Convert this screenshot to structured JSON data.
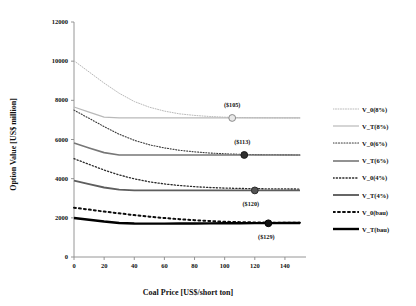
{
  "chart_data": {
    "type": "line",
    "title": "",
    "xlabel": "Coal Price [US$/short ton]",
    "ylabel": "Option Value [US$ million]",
    "xlim": [
      0,
      150
    ],
    "ylim": [
      0,
      12000
    ],
    "xticks": [
      0,
      20,
      40,
      60,
      80,
      100,
      120,
      140
    ],
    "yticks": [
      0,
      2000,
      4000,
      6000,
      8000,
      10000,
      12000
    ],
    "xtick_labels": [
      "0",
      "20",
      "40",
      "60",
      "80",
      "100",
      "120",
      "140"
    ],
    "ytick_labels": [
      "0",
      "2000",
      "4000",
      "6000",
      "8000",
      "10000",
      "12000"
    ],
    "grid": false,
    "legend_position": "right",
    "x": [
      0,
      10,
      20,
      30,
      40,
      50,
      60,
      70,
      80,
      90,
      100,
      110,
      120,
      130,
      140,
      150
    ],
    "series": [
      {
        "name": "V_0(8%)",
        "style": "dotted",
        "color": "#b9b9b9",
        "width": 1.0,
        "values": [
          10020,
          9450,
          8880,
          8360,
          7940,
          7650,
          7450,
          7310,
          7230,
          7175,
          7140,
          7120,
          7110,
          7105,
          7102,
          7100
        ]
      },
      {
        "name": "V_T(8%)",
        "style": "solid",
        "color": "#b9b9b9",
        "width": 1.2,
        "values": [
          7660,
          7400,
          7140,
          7100,
          7100,
          7100,
          7100,
          7100,
          7100,
          7100,
          7100,
          7100,
          7100,
          7100,
          7100,
          7100
        ]
      },
      {
        "name": "V_0(6%)",
        "style": "dotted",
        "color": "#3a3a3a",
        "width": 1.1,
        "values": [
          7500,
          7080,
          6660,
          6270,
          5960,
          5730,
          5570,
          5450,
          5370,
          5310,
          5270,
          5245,
          5230,
          5220,
          5215,
          5210
        ]
      },
      {
        "name": "V_T(6%)",
        "style": "solid",
        "color": "#777777",
        "width": 1.6,
        "values": [
          5820,
          5570,
          5330,
          5210,
          5210,
          5210,
          5210,
          5210,
          5210,
          5210,
          5210,
          5210,
          5210,
          5210,
          5210,
          5210
        ]
      },
      {
        "name": "V_0(4%)",
        "style": "dotted",
        "color": "#2b2b2b",
        "width": 1.3,
        "values": [
          5020,
          4730,
          4440,
          4190,
          3990,
          3840,
          3730,
          3650,
          3590,
          3550,
          3520,
          3500,
          3490,
          3480,
          3475,
          3470
        ]
      },
      {
        "name": "V_T(4%)",
        "style": "solid",
        "color": "#5e5e5e",
        "width": 1.9,
        "values": [
          3900,
          3720,
          3550,
          3440,
          3400,
          3400,
          3400,
          3400,
          3400,
          3400,
          3400,
          3400,
          3400,
          3400,
          3400,
          3400
        ]
      },
      {
        "name": "V_0(bau)",
        "style": "dotted",
        "color": "#0d0d0d",
        "width": 2.0,
        "values": [
          2520,
          2420,
          2320,
          2230,
          2140,
          2060,
          1990,
          1930,
          1880,
          1840,
          1800,
          1780,
          1765,
          1755,
          1750,
          1745
        ]
      },
      {
        "name": "V_T(bau)",
        "style": "solid",
        "color": "#000000",
        "width": 2.4,
        "values": [
          1990,
          1900,
          1810,
          1740,
          1710,
          1705,
          1705,
          1708,
          1712,
          1716,
          1720,
          1724,
          1728,
          1732,
          1736,
          1740
        ]
      }
    ],
    "annotations": [
      {
        "label": "($105)",
        "x": 105,
        "y": 7100,
        "marker": "open-circle",
        "marker_fill": "#e8e8e8",
        "marker_stroke": "#8c8c8c",
        "label_dx": 0,
        "label_dy": -13
      },
      {
        "label": "($113)",
        "x": 113,
        "y": 5210,
        "marker": "filled-circle",
        "marker_fill": "#2f2f2f",
        "marker_stroke": "#1a1a1a",
        "label_dx": -2,
        "label_dy": -13
      },
      {
        "label": "($120)",
        "x": 120,
        "y": 3400,
        "marker": "filled-circle",
        "marker_fill": "#545454",
        "marker_stroke": "#2a2a2a",
        "label_dx": -4,
        "label_dy": 14
      },
      {
        "label": "($129)",
        "x": 129,
        "y": 1722,
        "marker": "filled-circle",
        "marker_fill": "#111111",
        "marker_stroke": "#000000",
        "label_dx": -2,
        "label_dy": 14
      }
    ]
  }
}
